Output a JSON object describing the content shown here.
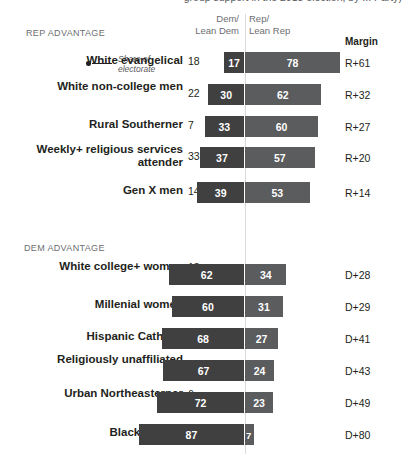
{
  "title_cut": "group support in the 2018 election, by ... Party)",
  "headers": {
    "dem_line1": "Dem/",
    "dem_line2": "Lean Dem",
    "rep_line1": "Rep/",
    "rep_line2": "Lean Rep",
    "margin": "Margin"
  },
  "annotation": {
    "line1": "Share of",
    "line2": "electorate"
  },
  "sections": [
    {
      "id": "rep-advantage",
      "label": "REP ADVANTAGE",
      "rows": [
        {
          "label": "White evangelical",
          "share": "18",
          "dem": 17,
          "rep": 78,
          "margin": "R+61"
        },
        {
          "label": "White non-college men",
          "share": "22",
          "dem": 30,
          "rep": 62,
          "margin": "R+32"
        },
        {
          "label": "Rural Southerner",
          "share": "7",
          "dem": 33,
          "rep": 60,
          "margin": "R+27"
        },
        {
          "label": "Weekly+ religious services attender",
          "share": "33",
          "dem": 37,
          "rep": 57,
          "margin": "R+20"
        },
        {
          "label": "Gen X men",
          "share": "14",
          "dem": 39,
          "rep": 53,
          "margin": "R+14"
        }
      ]
    },
    {
      "id": "dem-advantage",
      "label": "DEM ADVANTAGE",
      "rows": [
        {
          "label": "White college+ women",
          "share": "13",
          "dem": 62,
          "rep": 34,
          "margin": "D+28"
        },
        {
          "label": "Millenial women",
          "share": "11",
          "dem": 60,
          "rep": 31,
          "margin": "D+29"
        },
        {
          "label": "Hispanic Catholic",
          "share": "5",
          "dem": 68,
          "rep": 27,
          "margin": "D+41"
        },
        {
          "label": "Religiously unaffiliated",
          "share": "25",
          "dem": 67,
          "rep": 24,
          "margin": "D+43"
        },
        {
          "label": "Urban Northeasterner",
          "share": "6",
          "dem": 72,
          "rep": 23,
          "margin": "D+49"
        },
        {
          "label": "Black women",
          "share": "7",
          "dem": 87,
          "rep": 7,
          "margin": "D+80"
        }
      ]
    }
  ],
  "chart_data": {
    "type": "bar",
    "subtitle": "Share of electorate",
    "orientation": "horizontal-diverging",
    "center_value": 0,
    "xlabel": "",
    "ylabel": "",
    "legend": [
      "Dem/Lean Dem",
      "Rep/Lean Rep"
    ],
    "legend_position": "top",
    "grid": false,
    "columns": [
      "Group",
      "Share of electorate",
      "Dem/Lean Dem",
      "Rep/Lean Rep",
      "Margin"
    ],
    "categories": [
      "White evangelical",
      "White non-college men",
      "Rural Southerner",
      "Weekly+ religious services attender",
      "Gen X men",
      "White college+ women",
      "Millenial women",
      "Hispanic Catholic",
      "Religiously unaffiliated",
      "Urban Northeasterner",
      "Black women"
    ],
    "series": [
      {
        "name": "Share of electorate",
        "values": [
          18,
          22,
          7,
          33,
          14,
          13,
          11,
          5,
          25,
          6,
          7
        ]
      },
      {
        "name": "Dem/Lean Dem",
        "values": [
          17,
          30,
          33,
          37,
          39,
          62,
          60,
          68,
          67,
          72,
          87
        ]
      },
      {
        "name": "Rep/Lean Rep",
        "values": [
          78,
          62,
          60,
          57,
          53,
          34,
          31,
          27,
          24,
          23,
          7
        ]
      },
      {
        "name": "Margin",
        "values": [
          "R+61",
          "R+32",
          "R+27",
          "R+20",
          "R+14",
          "D+28",
          "D+29",
          "D+41",
          "D+43",
          "D+49",
          "D+80"
        ]
      }
    ],
    "groupings": {
      "REP ADVANTAGE": [
        "White evangelical",
        "White non-college men",
        "Rural Southerner",
        "Weekly+ religious services attender",
        "Gen X men"
      ],
      "DEM ADVANTAGE": [
        "White college+ women",
        "Millenial women",
        "Hispanic Catholic",
        "Religiously unaffiliated",
        "Urban Northeasterner",
        "Black women"
      ]
    },
    "colors": {
      "dem": "#404041",
      "rep": "#5b5c5e",
      "midline": "#d9dadb",
      "text": "#231f20",
      "muted": "#6d6e71"
    }
  },
  "layout": {
    "center_x": 245,
    "px_per_unit": 1.22,
    "row_tops": [
      52,
      84,
      116,
      147,
      182,
      264,
      296,
      328,
      360,
      392,
      424
    ],
    "label_tops": [
      54,
      80,
      118,
      143,
      184,
      260,
      298,
      330,
      353,
      387,
      426
    ]
  }
}
